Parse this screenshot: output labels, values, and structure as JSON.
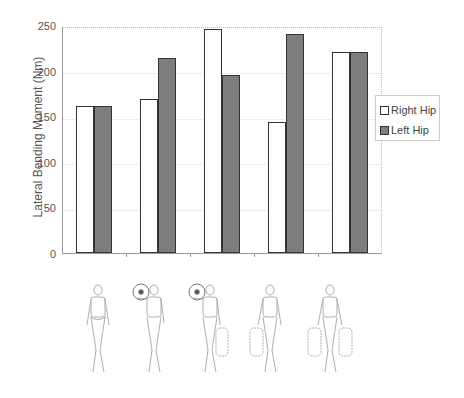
{
  "chart_data": {
    "type": "bar",
    "title": "",
    "xlabel": "",
    "ylabel": "Lateral Bending Moment (Nm)",
    "ylim": [
      0,
      250
    ],
    "yticks": [
      0,
      50,
      100,
      150,
      200,
      250
    ],
    "categories": [
      "No load",
      "Shoulder load",
      "Shoulder load + one-hand carry",
      "One-hand carry",
      "Two-hand carry"
    ],
    "series": [
      {
        "name": "Right Hip",
        "color": "#ffffff",
        "values": [
          163,
          170,
          248,
          145,
          222
        ]
      },
      {
        "name": "Left Hip",
        "color": "#7d7d7d",
        "values": [
          163,
          216,
          197,
          242,
          222
        ]
      }
    ],
    "legend_position": "right",
    "grid": true
  },
  "axis": {
    "ylabel": "Lateral Bending Moment (Nm)",
    "ticks": [
      "0",
      "50",
      "100",
      "150",
      "200",
      "250"
    ]
  },
  "legend": {
    "items": [
      {
        "label": "Right Hip"
      },
      {
        "label": "Left Hip"
      }
    ]
  },
  "figures": [
    {
      "icon": "walking-figure-no-load-icon"
    },
    {
      "icon": "walking-figure-shoulder-load-icon"
    },
    {
      "icon": "walking-figure-shoulder-and-hand-load-icon"
    },
    {
      "icon": "walking-figure-one-hand-load-icon"
    },
    {
      "icon": "walking-figure-two-hand-load-icon"
    }
  ]
}
